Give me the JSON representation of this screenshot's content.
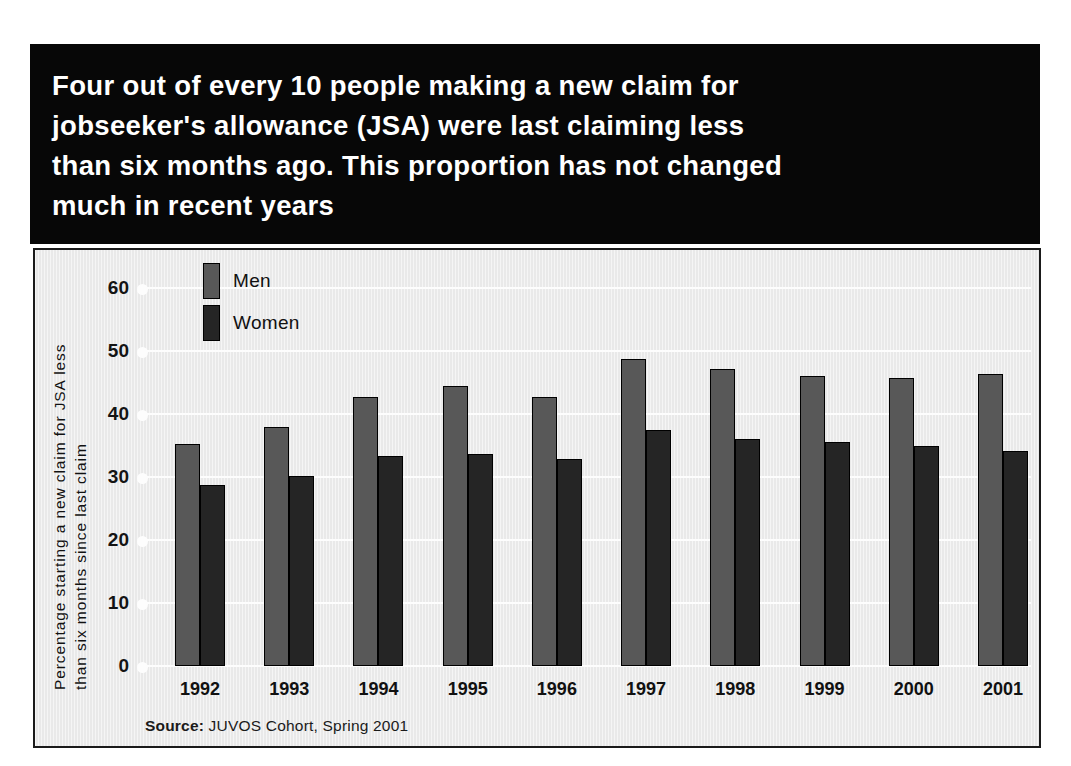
{
  "title": {
    "text": "Four out of every 10 people making a new claim for\njobseeker's allowance (JSA) were last claiming less\nthan six months ago. This proportion has not changed\nmuch in recent years"
  },
  "source": {
    "prefix": "Source:",
    "text": " JUVOS Cohort, Spring 2001"
  },
  "colors": {
    "banner_bg": "#070707",
    "panel_bg": "#e9e9e9",
    "men": "#585858",
    "women": "#252525",
    "gridline": "#fdfdfd",
    "text": "#111111"
  },
  "chart_data": {
    "type": "bar",
    "title": "",
    "xlabel": "",
    "ylabel": "Percentage starting a new claim for JSA less than six months since last claim",
    "ylabel_lines": [
      "Percentage starting a new claim for JSA less",
      "than six months since last claim"
    ],
    "categories": [
      "1992",
      "1993",
      "1994",
      "1995",
      "1996",
      "1997",
      "1998",
      "1999",
      "2000",
      "2001"
    ],
    "series": [
      {
        "name": "Men",
        "color": "#585858",
        "values": [
          35.3,
          38.0,
          42.7,
          44.5,
          42.7,
          48.8,
          47.2,
          46.0,
          45.7,
          46.4
        ]
      },
      {
        "name": "Women",
        "color": "#252525",
        "values": [
          28.8,
          30.2,
          33.4,
          33.7,
          32.9,
          37.5,
          36.0,
          35.5,
          35.0,
          34.2
        ]
      }
    ],
    "ylim": [
      0,
      60
    ],
    "yticks": [
      0,
      10,
      20,
      30,
      40,
      50,
      60
    ],
    "ytick_labels": [
      "0",
      "10",
      "20",
      "30",
      "40",
      "50",
      "60"
    ],
    "grid": true,
    "legend": {
      "position": "upper-left-inside",
      "entries": [
        "Men",
        "Women"
      ]
    }
  }
}
